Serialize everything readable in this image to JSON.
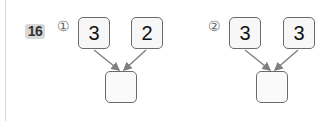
{
  "question_number": "16",
  "problems": [
    {
      "label": "①",
      "top_values": [
        "3",
        "2"
      ],
      "answer": ""
    },
    {
      "label": "②",
      "top_values": [
        "3",
        "3"
      ],
      "answer": ""
    }
  ],
  "colors": {
    "box_border": "#6b6b6b",
    "arrow": "#808080",
    "badge": "#d9d9d9"
  }
}
